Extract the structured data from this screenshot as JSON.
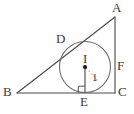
{
  "figure": {
    "kind": "geometry-diagram",
    "canvas": {
      "width": 134,
      "height": 114
    },
    "colors": {
      "background": "#ffffff",
      "stroke": "#4a4a4a",
      "label": "#3a3a3a",
      "circle_stroke": "#6a6a6a",
      "radius_stroke": "#555555",
      "dashed_stroke": "#8a8a8a",
      "center_dot": "#1a1a1a"
    },
    "triangle": {
      "name": "triangle-ABC",
      "vertices": [
        {
          "id": "A",
          "x": 115,
          "y": 17
        },
        {
          "id": "B",
          "x": 17,
          "y": 93
        },
        {
          "id": "C",
          "x": 115,
          "y": 93
        }
      ],
      "edges": [
        {
          "id": "AB",
          "from": "A",
          "to": "B"
        },
        {
          "id": "BC",
          "from": "B",
          "to": "C"
        },
        {
          "id": "CA",
          "from": "C",
          "to": "A"
        }
      ]
    },
    "circle": {
      "name": "inscribed-circle",
      "cx": 85,
      "cy": 67,
      "r": 25.5
    },
    "center_point": {
      "id": "I",
      "x": 85,
      "y": 67
    },
    "tangent_points": [
      {
        "id": "D",
        "x": 66.5,
        "y": 49.7
      },
      {
        "id": "E",
        "x": 85,
        "y": 92.5
      },
      {
        "id": "F",
        "x": 110.5,
        "y": 67
      }
    ],
    "radius_segment": {
      "from": "I",
      "to": "E",
      "x1": 85,
      "y1": 67,
      "x2": 85,
      "y2": 92.5
    },
    "dashed_segment": {
      "from": "I",
      "to": "F",
      "x1": 85,
      "y1": 67,
      "x2": 110.5,
      "y2": 67
    },
    "right_angle_marker": {
      "at": "E",
      "x": 78.5,
      "y": 86.5,
      "size": 6.5
    },
    "labels": [
      {
        "id": "label-A",
        "text": "A",
        "x": 112,
        "y": 1,
        "size": "normal"
      },
      {
        "id": "label-B",
        "text": "B",
        "x": 3,
        "y": 87,
        "size": "normal"
      },
      {
        "id": "label-C",
        "text": "C",
        "x": 118,
        "y": 87,
        "size": "normal"
      },
      {
        "id": "label-D",
        "text": "D",
        "x": 56,
        "y": 34,
        "size": "normal"
      },
      {
        "id": "label-E",
        "text": "E",
        "x": 81,
        "y": 95,
        "size": "normal"
      },
      {
        "id": "label-F",
        "text": "F",
        "x": 118,
        "y": 61,
        "size": "normal"
      },
      {
        "id": "label-I",
        "text": "I",
        "x": 83,
        "y": 54,
        "size": "normal"
      },
      {
        "id": "label-one",
        "text": "1",
        "x": 92,
        "y": 74,
        "size": "small"
      }
    ]
  }
}
